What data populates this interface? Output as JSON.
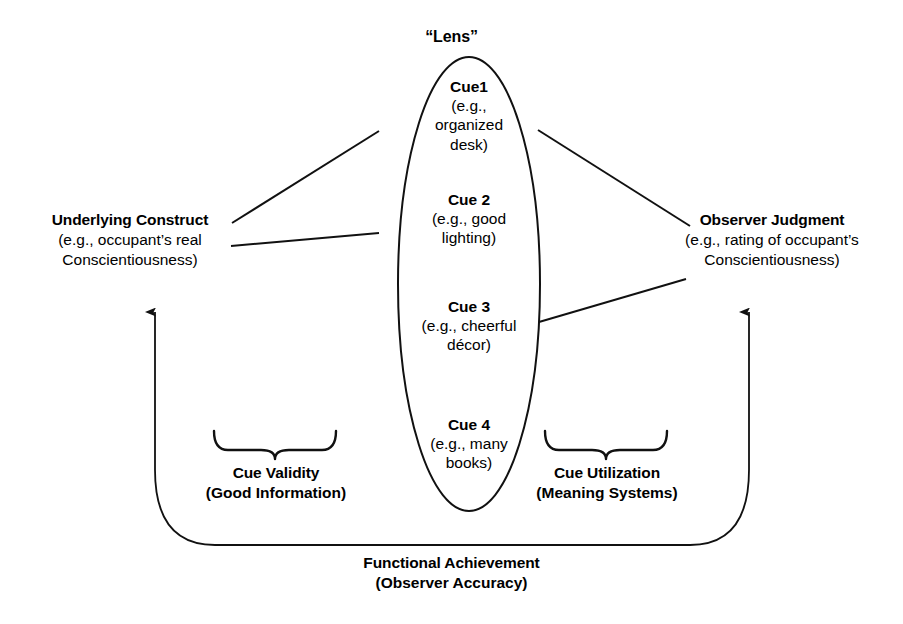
{
  "diagram": {
    "lens_caption": "“Lens”",
    "line_color": "#111111",
    "text_color": "#000000",
    "background": "#ffffff"
  },
  "lens": {
    "cues": [
      {
        "name": "Cue1",
        "example_lines": [
          "(e.g.,",
          "organized",
          "desk)"
        ]
      },
      {
        "name": "Cue 2",
        "example_lines": [
          "(e.g., good",
          "lighting)"
        ]
      },
      {
        "name": "Cue 3",
        "example_lines": [
          "(e.g., cheerful",
          "décor)"
        ]
      },
      {
        "name": "Cue 4",
        "example_lines": [
          "(e.g., many",
          "books)"
        ]
      }
    ]
  },
  "nodes": {
    "construct": {
      "title": "Underlying Construct",
      "detail_lines": [
        "(e.g., occupant’s real",
        "Conscientiousness)"
      ]
    },
    "judgment": {
      "title": "Observer Judgment",
      "detail_lines": [
        "(e.g., rating of occupant’s",
        "Conscientiousness)"
      ]
    }
  },
  "brackets": {
    "left": {
      "title": "Cue Validity",
      "subtitle": "(Good Information)"
    },
    "right": {
      "title": "Cue Utilization",
      "subtitle": "(Meaning Systems)"
    }
  },
  "bottom": {
    "title": "Functional Achievement",
    "subtitle": "(Observer Accuracy)"
  }
}
